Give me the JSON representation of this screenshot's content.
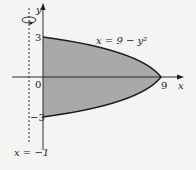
{
  "diagram": {
    "curve_label": "x = 9 − y²",
    "axis_x_label": "x",
    "axis_y_label": "y",
    "tick_y_top": "3",
    "tick_y_bottom": "−3",
    "origin_label": "0",
    "tick_x_right": "9",
    "rotation_axis_label": "x = −1",
    "colors": {
      "region_fill": "#a9a9a9",
      "stroke": "#1a1a1a",
      "background": "#f4f4f2"
    }
  }
}
